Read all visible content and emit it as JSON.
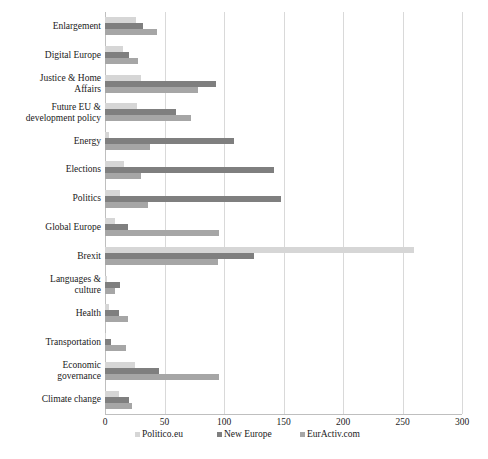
{
  "chart_data": {
    "type": "bar",
    "orientation": "horizontal",
    "title": "",
    "subtitle": "",
    "xlabel": "",
    "ylabel": "",
    "xlim": [
      0,
      300
    ],
    "xticks": [
      0,
      50,
      100,
      150,
      200,
      250,
      300
    ],
    "xtick_labels": [
      "0",
      "50",
      "100",
      "150",
      "200",
      "250",
      "300"
    ],
    "grid": true,
    "grid_axis": "x",
    "legend_position": "bottom",
    "categories": [
      "Enlargement",
      "Digital Europe",
      "Justice & Home\nAffairs",
      "Future EU &\ndevelopment policy",
      "Energy",
      "Elections",
      "Politics",
      "Global Europe",
      "Brexit",
      "Languages &\nculture",
      "Health",
      "Transportation",
      "Economic\ngovernance",
      "Climate change"
    ],
    "series": [
      {
        "name": "Politico.eu",
        "color": "#d6d6d6",
        "values": [
          26,
          15,
          30,
          27,
          3,
          16,
          13,
          8,
          260,
          2,
          3,
          1,
          25,
          12
        ]
      },
      {
        "name": "New Europe",
        "color": "#7f7f7f",
        "values": [
          32,
          20,
          93,
          60,
          108,
          142,
          148,
          19,
          125,
          13,
          12,
          5,
          45,
          20
        ]
      },
      {
        "name": "EurActiv.com",
        "color": "#a6a6a6",
        "values": [
          44,
          28,
          78,
          72,
          38,
          30,
          36,
          96,
          95,
          8,
          19,
          18,
          96,
          23
        ]
      }
    ]
  },
  "legend": {
    "items": [
      {
        "label": "Politico.eu",
        "color": "#d6d6d6"
      },
      {
        "label": "New Europe",
        "color": "#7f7f7f"
      },
      {
        "label": "EurActiv.com",
        "color": "#a6a6a6"
      }
    ]
  },
  "colors": {
    "background": "#ffffff",
    "gridline": "#d9d9d9",
    "axis": "#bfbfbf",
    "text": "#1a1a1a"
  }
}
